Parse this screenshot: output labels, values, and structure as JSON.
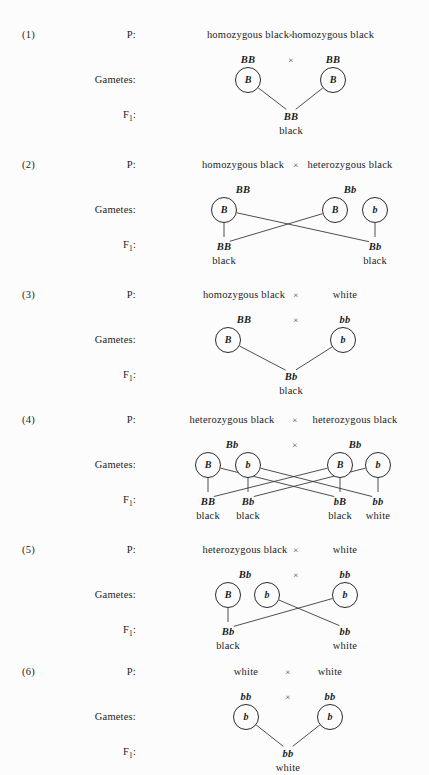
{
  "figure": {
    "row_labels": {
      "parents": "P:",
      "gametes": "Gametes:",
      "offspring_prefix": "F",
      "offspring_subscript": "1",
      "offspring_suffix": ":"
    },
    "cross_symbol": "×",
    "ink_color": "#1c1c1c",
    "background_color": "#fcfcfc"
  },
  "crosses": [
    {
      "number": "(1)",
      "parents": {
        "left": "homozygous black",
        "right": "homozygous black"
      },
      "genotypes": {
        "left": "BB",
        "right": "BB",
        "show_cross_symbol": true
      },
      "gametes": [
        {
          "label": "B"
        },
        {
          "label": "B"
        }
      ],
      "offspring": [
        {
          "genotype": "BB",
          "phenotype": "black"
        }
      ]
    },
    {
      "number": "(2)",
      "parents": {
        "left": "homozygous black",
        "right": "heterozygous black"
      },
      "genotypes": {
        "left": "BB",
        "right": "Bb",
        "show_cross_symbol": false
      },
      "gametes": [
        {
          "label": "B"
        },
        {
          "label": "B"
        },
        {
          "label": "b"
        }
      ],
      "offspring": [
        {
          "genotype": "BB",
          "phenotype": "black"
        },
        {
          "genotype": "Bb",
          "phenotype": "black"
        }
      ]
    },
    {
      "number": "(3)",
      "parents": {
        "left": "homozygous black",
        "right": "white"
      },
      "genotypes": {
        "left": "BB",
        "right": "bb",
        "show_cross_symbol": true
      },
      "gametes": [
        {
          "label": "B"
        },
        {
          "label": "b"
        }
      ],
      "offspring": [
        {
          "genotype": "Bb",
          "phenotype": "black"
        }
      ]
    },
    {
      "number": "(4)",
      "parents": {
        "left": "heterozygous black",
        "right": "heterozygous black"
      },
      "genotypes": {
        "left": "Bb",
        "right": "Bb",
        "show_cross_symbol": true
      },
      "gametes": [
        {
          "label": "B"
        },
        {
          "label": "b"
        },
        {
          "label": "B"
        },
        {
          "label": "b"
        }
      ],
      "offspring": [
        {
          "genotype": "BB",
          "phenotype": "black"
        },
        {
          "genotype": "Bb",
          "phenotype": "black"
        },
        {
          "genotype": "bB",
          "phenotype": "black"
        },
        {
          "genotype": "bb",
          "phenotype": "white"
        }
      ]
    },
    {
      "number": "(5)",
      "parents": {
        "left": "heterozygous black",
        "right": "white"
      },
      "genotypes": {
        "left": "Bb",
        "right": "bb",
        "show_cross_symbol": true
      },
      "gametes": [
        {
          "label": "B"
        },
        {
          "label": "b"
        },
        {
          "label": "b"
        }
      ],
      "offspring": [
        {
          "genotype": "Bb",
          "phenotype": "black"
        },
        {
          "genotype": "bb",
          "phenotype": "white"
        }
      ]
    },
    {
      "number": "(6)",
      "parents": {
        "left": "white",
        "right": "white"
      },
      "genotypes": {
        "left": "bb",
        "right": "bb",
        "show_cross_symbol": true
      },
      "gametes": [
        {
          "label": "b"
        },
        {
          "label": "b"
        }
      ],
      "offspring": [
        {
          "genotype": "bb",
          "phenotype": "white"
        }
      ]
    }
  ],
  "layout": {
    "cross_tops": [
      18,
      148,
      278,
      403,
      533,
      655
    ],
    "rows": {
      "parents_y": 11,
      "genotype_y": 36,
      "gamete_y": 62,
      "offspring_geno_y": 93,
      "offspring_pheno_y": 107
    },
    "geometry": [
      {
        "parent_left_x": 248,
        "parent_right_x": 333,
        "times_x": 291,
        "gametes_x": [
          248,
          333
        ],
        "offspring_x": [
          291
        ],
        "links": [
          [
            0,
            0
          ],
          [
            1,
            0
          ]
        ]
      },
      {
        "parent_left_x": 243,
        "parent_right_x": 350,
        "times_x": 296,
        "gametes_x": [
          224,
          335,
          375
        ],
        "offspring_x": [
          224,
          375
        ],
        "links": [
          [
            0,
            0
          ],
          [
            0,
            1
          ],
          [
            1,
            0
          ],
          [
            2,
            1
          ]
        ]
      },
      {
        "parent_left_x": 244,
        "parent_right_x": 345,
        "times_x": 296,
        "gametes_x": [
          228,
          343
        ],
        "offspring_x": [
          291
        ],
        "links": [
          [
            0,
            0
          ],
          [
            1,
            0
          ]
        ]
      },
      {
        "parent_left_x": 232,
        "parent_right_x": 355,
        "times_x": 295,
        "gametes_x": [
          208,
          248,
          340,
          378
        ],
        "offspring_x": [
          208,
          248,
          340,
          378
        ],
        "links": [
          [
            0,
            0
          ],
          [
            0,
            2
          ],
          [
            1,
            1
          ],
          [
            1,
            3
          ],
          [
            2,
            0
          ],
          [
            2,
            2
          ],
          [
            3,
            1
          ],
          [
            3,
            3
          ]
        ]
      },
      {
        "parent_left_x": 245,
        "parent_right_x": 345,
        "times_x": 296,
        "gametes_x": [
          228,
          267,
          345
        ],
        "offspring_x": [
          228,
          345
        ],
        "links": [
          [
            0,
            0
          ],
          [
            1,
            1
          ],
          [
            2,
            0
          ]
        ]
      },
      {
        "parent_left_x": 246,
        "parent_right_x": 330,
        "times_x": 288,
        "gametes_x": [
          246,
          330
        ],
        "offspring_x": [
          288
        ],
        "links": [
          [
            0,
            0
          ],
          [
            1,
            0
          ]
        ]
      }
    ]
  }
}
